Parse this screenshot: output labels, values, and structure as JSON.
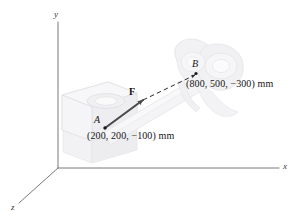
{
  "figure": {
    "type": "3d-force-vector-diagram",
    "background_color": "#ffffff",
    "axes": {
      "x_label": "x",
      "y_label": "y",
      "z_label": "z",
      "axis_color": "#7a7a7a",
      "origin_px": [
        58,
        168
      ]
    },
    "points": {
      "a": {
        "name": "A",
        "label": "A",
        "coordinates_text": "(200, 200, −100) mm",
        "coordinates": [
          200,
          200,
          -100
        ],
        "units": "mm",
        "marker_px": [
          105,
          128
        ]
      },
      "b": {
        "name": "B",
        "label": "B",
        "coordinates_text": "(800, 500, −300) mm",
        "coordinates": [
          800,
          500,
          -300
        ],
        "units": "mm",
        "marker_px": [
          196,
          73
        ]
      }
    },
    "force": {
      "label": "F",
      "color": "#4a4a4a",
      "description": "force vector from A toward B",
      "arrow_tip_px": [
        143,
        100
      ]
    },
    "geometry": {
      "bracket_fill": "#f2f2f4",
      "bracket_stroke": "#dcdce0",
      "clevis_fill": "#f1f1f3",
      "link_fill": "#f4f4f6"
    }
  }
}
